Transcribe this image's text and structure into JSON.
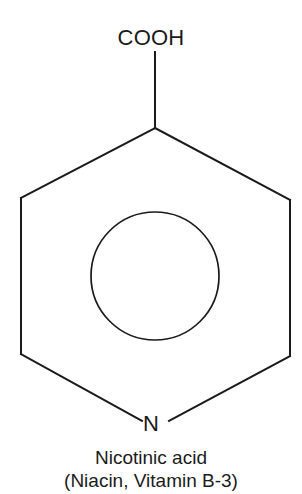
{
  "figure": {
    "kind": "chemical-structure-diagram",
    "background_color": "#ffffff",
    "stroke_color": "#1b1b1b",
    "text_color": "#1b1b1b"
  },
  "molecule": {
    "substituent_label": "COOH",
    "heteroatom_label": "N",
    "ring_type": "aromatic-pyridine-ring",
    "aromatic_circle": true
  },
  "caption": {
    "line1": "Nicotinic acid",
    "line2": "(Niacin, Vitamin B-3)"
  },
  "geometry": {
    "hexagon_points": "155,128 290,200 290,356 155,428 21,354 21,198",
    "ring_circle": {
      "cx": 155,
      "cy": 276,
      "r": 64
    },
    "substituent_bond": {
      "x1": 155,
      "y1": 52,
      "x2": 155,
      "y2": 128
    },
    "bond_to_n_left": {
      "x1": 21,
      "y1": 354,
      "x2": 143,
      "y2": 421
    },
    "bond_to_n_right": {
      "x1": 290,
      "y1": 356,
      "x2": 168,
      "y2": 421
    },
    "stroke_width": 2
  }
}
